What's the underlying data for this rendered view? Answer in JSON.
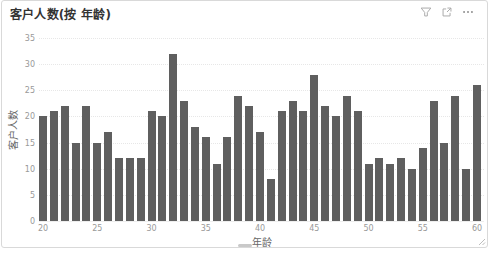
{
  "card": {
    "title": "客户人数(按 年龄)",
    "toolbar": {
      "filter": "filter-funnel",
      "focus": "focus-mode-expand",
      "more": "more-options-ellipsis"
    }
  },
  "chart_data": {
    "type": "bar",
    "title": "客户人数(按 年龄)",
    "xlabel": "年龄",
    "ylabel": "客户人数",
    "x": [
      20,
      21,
      22,
      23,
      24,
      25,
      26,
      27,
      28,
      29,
      30,
      31,
      32,
      33,
      34,
      35,
      36,
      37,
      38,
      39,
      40,
      41,
      42,
      43,
      44,
      45,
      46,
      47,
      48,
      49,
      50,
      51,
      52,
      53,
      54,
      55,
      56,
      57,
      58,
      59,
      60
    ],
    "values": [
      20,
      21,
      22,
      15,
      22,
      15,
      17,
      12,
      12,
      12,
      21,
      20,
      32,
      23,
      18,
      16,
      11,
      16,
      24,
      22,
      17,
      8,
      21,
      23,
      21,
      28,
      22,
      20,
      24,
      21,
      11,
      12,
      11,
      12,
      10,
      14,
      23,
      15,
      24,
      10,
      26
    ],
    "ylim": [
      0,
      35
    ],
    "ytick_interval": 5,
    "ytick_labels": [
      "0",
      "5",
      "10",
      "15",
      "20",
      "25",
      "30",
      "35"
    ],
    "xtick_labels": [
      "20",
      "25",
      "30",
      "35",
      "40",
      "45",
      "50",
      "55",
      "60"
    ],
    "xtick_step": 5,
    "bar_color": "#5f5f5f",
    "grid": "horizontal-dotted",
    "legend": "none"
  }
}
